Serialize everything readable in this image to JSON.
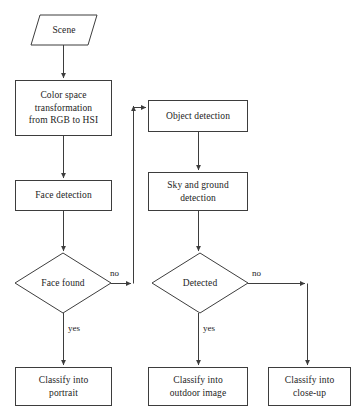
{
  "diagram": {
    "stroke_color": "#3d3d3d",
    "text_color": "#1c1c1c",
    "background_color": "#ffffff",
    "nodes": [
      {
        "id": "scene",
        "shape": "parallelogram",
        "lines": [
          "Scene"
        ]
      },
      {
        "id": "colorspace",
        "shape": "rectangle",
        "lines": [
          "Color space",
          "transformation",
          "from RGB to HSI"
        ]
      },
      {
        "id": "facedet",
        "shape": "rectangle",
        "lines": [
          "Face detection"
        ]
      },
      {
        "id": "facefound",
        "shape": "diamond",
        "lines": [
          "Face found"
        ]
      },
      {
        "id": "portrait",
        "shape": "rectangle",
        "lines": [
          "Classify into",
          "portrait"
        ]
      },
      {
        "id": "objectdet",
        "shape": "rectangle",
        "lines": [
          "Object detection"
        ]
      },
      {
        "id": "skyground",
        "shape": "rectangle",
        "lines": [
          "Sky and ground",
          "detection"
        ]
      },
      {
        "id": "detected",
        "shape": "diamond",
        "lines": [
          "Detected"
        ]
      },
      {
        "id": "outdoor",
        "shape": "rectangle",
        "lines": [
          "Classify into",
          "outdoor image"
        ]
      },
      {
        "id": "closeup",
        "shape": "rectangle",
        "lines": [
          "Classify into",
          "close-up"
        ]
      }
    ],
    "edge_labels": [
      {
        "id": "facefound-no",
        "text": "no"
      },
      {
        "id": "facefound-yes",
        "text": "yes"
      },
      {
        "id": "detected-no",
        "text": "no"
      },
      {
        "id": "detected-yes",
        "text": "yes"
      }
    ],
    "edges": [
      {
        "from": "scene",
        "to": "colorspace",
        "label": ""
      },
      {
        "from": "colorspace",
        "to": "facedet",
        "label": ""
      },
      {
        "from": "facedet",
        "to": "facefound",
        "label": ""
      },
      {
        "from": "facefound",
        "to": "portrait",
        "label": "yes"
      },
      {
        "from": "facefound",
        "to": "objectdet",
        "label": "no"
      },
      {
        "from": "objectdet",
        "to": "skyground",
        "label": ""
      },
      {
        "from": "skyground",
        "to": "detected",
        "label": ""
      },
      {
        "from": "detected",
        "to": "outdoor",
        "label": "yes"
      },
      {
        "from": "detected",
        "to": "closeup",
        "label": "no"
      }
    ]
  }
}
